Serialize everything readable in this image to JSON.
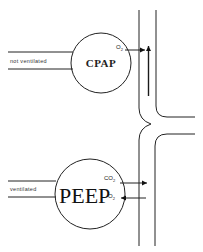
{
  "diagram": {
    "top_unit": {
      "airway_label": "not ventilated",
      "alveolus_label": "CPAP",
      "gas_label": "O",
      "gas_subscript": "2",
      "flow_direction": "up"
    },
    "bottom_unit": {
      "airway_label": "ventilated",
      "alveolus_label": "PEEP",
      "gas_out_label": "CO",
      "gas_out_subscript": "2",
      "gas_in_label": "O",
      "gas_in_subscript": "2"
    },
    "colors": {
      "line": "#222222",
      "background": "#ffffff"
    }
  }
}
